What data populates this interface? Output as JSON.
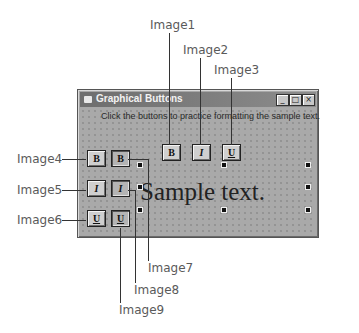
{
  "window": {
    "title": "Graphical Buttons",
    "controls": {
      "minimize": "_",
      "maximize": "□",
      "close": "×"
    },
    "instruction": "Click the buttons to practice formatting the sample text.",
    "sample_text": "Sample text."
  },
  "buttons": {
    "top": [
      {
        "id": "Image1",
        "glyph": "B",
        "style": "bold"
      },
      {
        "id": "Image2",
        "glyph": "I",
        "style": "italic"
      },
      {
        "id": "Image3",
        "glyph": "U",
        "style": "underline"
      }
    ],
    "left_up": [
      {
        "id": "Image4",
        "glyph": "B",
        "style": "bold"
      },
      {
        "id": "Image5",
        "glyph": "I",
        "style": "italic"
      },
      {
        "id": "Image6",
        "glyph": "U",
        "style": "underline"
      }
    ],
    "left_down": [
      {
        "id": "Image7",
        "glyph": "B",
        "style": "bold"
      },
      {
        "id": "Image8",
        "glyph": "I",
        "style": "italic"
      },
      {
        "id": "Image9",
        "glyph": "U",
        "style": "underline"
      }
    ]
  },
  "callouts": {
    "image1": "Image1",
    "image2": "Image2",
    "image3": "Image3",
    "image4": "Image4",
    "image5": "Image5",
    "image6": "Image6",
    "image7": "Image7",
    "image8": "Image8",
    "image9": "Image9"
  }
}
